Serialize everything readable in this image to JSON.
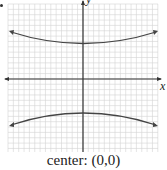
{
  "chart_data": {
    "type": "line",
    "title": "",
    "caption": "center: (0,0)",
    "xlabel": "x",
    "ylabel": "y",
    "grid": true,
    "xlim": [
      -7,
      7
    ],
    "ylim": [
      -7,
      7
    ],
    "equation": "y^2/9 - x^2/b^2 = 1",
    "series": [
      {
        "name": "upper branch",
        "x": [
          -7,
          -5,
          -3,
          0,
          3,
          5,
          7
        ],
        "y": [
          4.4,
          3.7,
          3.3,
          3,
          3.3,
          3.7,
          4.4
        ]
      },
      {
        "name": "lower branch",
        "x": [
          -7,
          -5,
          -3,
          0,
          3,
          5,
          7
        ],
        "y": [
          -4.4,
          -3.7,
          -3.3,
          -3,
          -3.3,
          -3.7,
          -4.4
        ]
      }
    ],
    "center": [
      0,
      0
    ]
  },
  "labels": {
    "x_axis": "x",
    "y_axis": "y",
    "caption": "center: (0,0)"
  },
  "colors": {
    "grid": "#d4d4d4",
    "axis": "#333333",
    "curve": "#444444"
  }
}
